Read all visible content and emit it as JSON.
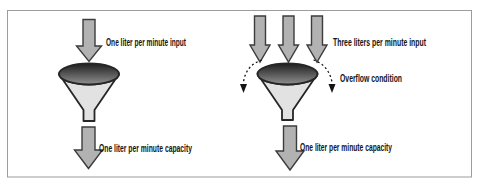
{
  "figure": {
    "type": "funnel-capacity-diagram",
    "left_panel": {
      "input_label": "One liter per minute input",
      "capacity_label": "One liter per minute capacity"
    },
    "right_panel": {
      "input_label": "Three liters per minute input",
      "overflow_label": "Overflow condition",
      "capacity_label": "One liter per minute capacity"
    },
    "colors": {
      "background": "#ffffff",
      "border": "#9c9c9c",
      "arrow_fill": "#b2b2b2",
      "arrow_outline": "#3c3c3c",
      "cone_fill": "#e2e2e2",
      "funnel_outline": "#262626",
      "rim_gradient_top": "#1e1e1e",
      "rim_gradient_bottom": "#909090",
      "overflow_stroke": "#141414",
      "text": "#141414"
    }
  }
}
